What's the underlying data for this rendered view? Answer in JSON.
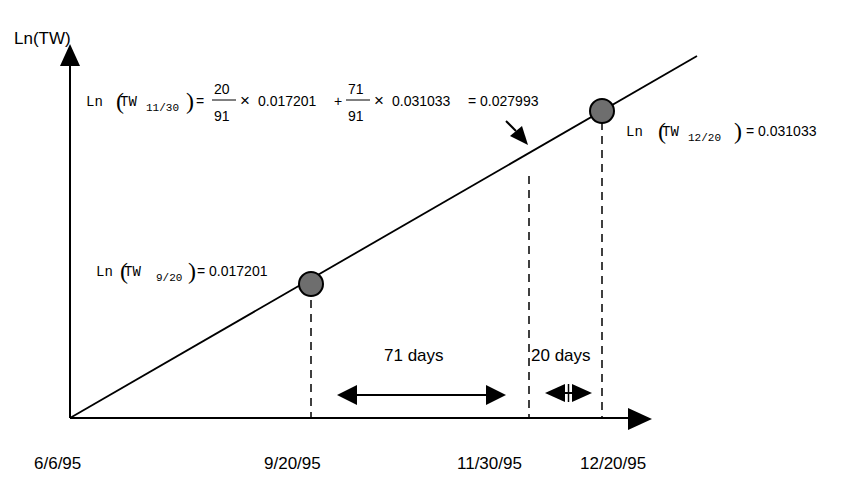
{
  "diagram": {
    "y_axis_label": "Ln(TW)",
    "x_tick_labels": [
      "6/6/95",
      "9/20/95",
      "11/30/95",
      "12/20/95"
    ],
    "interval_labels": {
      "long": "71 days",
      "short": "20 days"
    },
    "points": {
      "p920": {
        "prefix": "Ln",
        "var": "TW",
        "sub": "9/20",
        "value": "= 0.017201"
      },
      "p1220": {
        "prefix": "Ln",
        "var": "TW",
        "sub": "12/20",
        "value": "= 0.031033"
      }
    },
    "interpolation": {
      "prefix": "Ln",
      "var": "TW",
      "sub": "11/30",
      "eq": "=",
      "frac1_num": "20",
      "frac1_den": "91",
      "times1": "×",
      "val1": "0.017201",
      "plus": "+",
      "frac2_num": "71",
      "frac2_den": "91",
      "times2": "×",
      "val2": "0.031033",
      "result": "= 0.027993"
    },
    "colors": {
      "line": "#000000",
      "point_fill": "#6e6e6e",
      "background": "#ffffff"
    }
  }
}
